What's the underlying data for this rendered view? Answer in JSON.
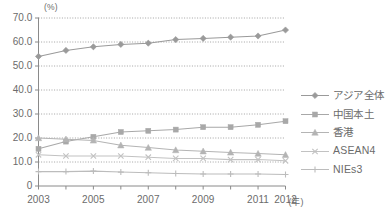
{
  "chart_data": {
    "type": "line",
    "title": "",
    "xlabel": "(年)",
    "ylabel": "(%)",
    "unit_label": "(%)",
    "x_unit_label": "(年)",
    "x": [
      2003,
      2004,
      2005,
      2006,
      2007,
      2008,
      2009,
      2010,
      2011,
      2012
    ],
    "x_tick_labels": [
      "2003",
      "2005",
      "2007",
      "2009",
      "2011",
      "2012"
    ],
    "x_tick_values": [
      2003,
      2005,
      2007,
      2009,
      2011,
      2012
    ],
    "categories": [
      "2003",
      "2004",
      "2005",
      "2006",
      "2007",
      "2008",
      "2009",
      "2010",
      "2011",
      "2012"
    ],
    "ylim": [
      0,
      70
    ],
    "xlim": [
      2003,
      2012
    ],
    "y_ticks": [
      0,
      10,
      20,
      30,
      40,
      50,
      60,
      70
    ],
    "y_tick_labels": [
      "0",
      "10.0",
      "20.0",
      "30.0",
      "40.0",
      "50.0",
      "60.0",
      "70.0"
    ],
    "grid": true,
    "grid_style": "dotted-horizontal",
    "legend_position": "right",
    "series": [
      {
        "name": "アジア全体",
        "marker": "diamond",
        "color": "#9a9a9a",
        "values": [
          54.0,
          56.5,
          58.0,
          59.0,
          59.5,
          61.0,
          61.5,
          62.0,
          62.5,
          65.0
        ]
      },
      {
        "name": "中国本土",
        "marker": "square",
        "color": "#a8a8a8",
        "values": [
          15.5,
          18.5,
          20.5,
          22.5,
          23.0,
          23.5,
          24.5,
          24.5,
          25.5,
          27.0
        ]
      },
      {
        "name": "香港",
        "marker": "triangle",
        "color": "#b4b4b4",
        "values": [
          20.0,
          19.5,
          19.0,
          17.0,
          16.0,
          15.0,
          14.5,
          14.0,
          13.5,
          13.0
        ]
      },
      {
        "name": "ASEAN4",
        "marker": "x",
        "color": "#c2c2c2",
        "values": [
          13.0,
          12.5,
          12.5,
          12.5,
          12.0,
          11.5,
          11.5,
          11.0,
          11.0,
          10.5
        ]
      },
      {
        "name": "NIEs3",
        "marker": "plus",
        "color": "#bcbcbc",
        "values": [
          6.0,
          6.0,
          6.2,
          5.8,
          5.5,
          5.2,
          5.0,
          5.0,
          5.0,
          4.8
        ]
      }
    ]
  },
  "axis": {
    "y_unit": "(%)",
    "x_unit": "(年)"
  }
}
